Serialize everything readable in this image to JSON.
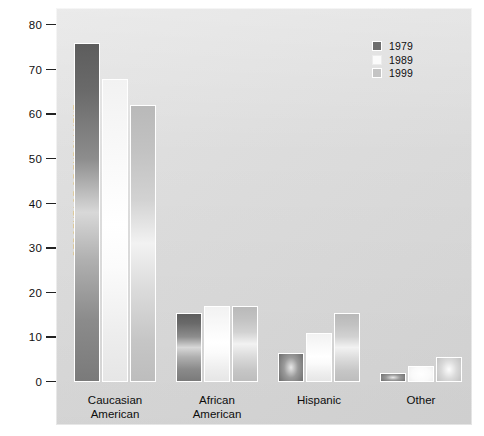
{
  "chart_data": {
    "type": "bar",
    "title": "",
    "xlabel": "",
    "ylabel": "PERCENTAGE OF ENROLLMENT",
    "ylim": [
      0,
      80
    ],
    "yticks": [
      0,
      10,
      20,
      30,
      40,
      50,
      60,
      70,
      80
    ],
    "ytick_labels": [
      "0",
      "10",
      "20",
      "30",
      "40",
      "50",
      "60",
      "70",
      "80"
    ],
    "grid": false,
    "legend_position": "top-right",
    "categories": [
      "Caucasian\nAmerican",
      "African\nAmerican",
      "Hispanic",
      "Other"
    ],
    "series": [
      {
        "name": "1979",
        "color": "#6e6e6e",
        "values": [
          76,
          15.5,
          6.5,
          2
        ]
      },
      {
        "name": "1989",
        "color": "#fbfbfb",
        "values": [
          68,
          17,
          11,
          3.5
        ]
      },
      {
        "name": "1999",
        "color": "#c4c4c4",
        "values": [
          62,
          17,
          15.5,
          5.5
        ]
      }
    ]
  },
  "legend": {
    "items": [
      {
        "label": "1979",
        "swatch": "s1979"
      },
      {
        "label": "1989",
        "swatch": "s1989"
      },
      {
        "label": "1999",
        "swatch": "s1999"
      }
    ]
  },
  "axis": {
    "y_title": "PERCENTAGE OF ENROLLMENT",
    "y_ticks": [
      "80",
      "70",
      "60",
      "50",
      "40",
      "30",
      "20",
      "10",
      "0"
    ]
  },
  "groups": [
    {
      "line1": "Caucasian",
      "line2": "American"
    },
    {
      "line1": "African",
      "line2": "American"
    },
    {
      "line1": "Hispanic",
      "line2": ""
    },
    {
      "line1": "Other",
      "line2": ""
    }
  ],
  "colors": {
    "panel_background": "#dcdcdc",
    "page_background": "#ffffff",
    "series_1979": "#6e6e6e",
    "series_1989": "#fbfbfb",
    "series_1999": "#c4c4c4",
    "text": "#101010"
  }
}
